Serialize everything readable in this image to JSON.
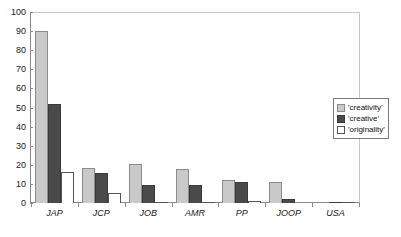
{
  "chart_data": {
    "type": "bar",
    "title": "",
    "subtitle": "",
    "xlabel": "",
    "ylabel": "",
    "ylim": [
      0,
      100
    ],
    "ytick_step": 10,
    "yticks": [
      0,
      10,
      20,
      30,
      40,
      50,
      60,
      70,
      80,
      90,
      100
    ],
    "ytick_labels": [
      "0",
      "10",
      "20",
      "30",
      "40",
      "50",
      "60",
      "70",
      "80",
      "90",
      "100"
    ],
    "grid": false,
    "legend_position": "right",
    "categories": [
      "JAP",
      "JCP",
      "JOB",
      "AMR",
      "PP",
      "JOOP",
      "USA"
    ],
    "series": [
      {
        "name": "'creativity'",
        "color": "#c9c9c9",
        "values": [
          90,
          18.5,
          20.5,
          18,
          12,
          11,
          0.6
        ]
      },
      {
        "name": "'creative'",
        "color": "#4a4a4a",
        "values": [
          52,
          15.5,
          9.5,
          9.3,
          11,
          2.2,
          0.3
        ]
      },
      {
        "name": "'originality'",
        "color": "#ffffff",
        "values": [
          16,
          5.5,
          0.7,
          0.7,
          1.2,
          0,
          0.6
        ]
      }
    ]
  },
  "legend": {
    "items": [
      {
        "label": "'creativity'"
      },
      {
        "label": "'creative'"
      },
      {
        "label": "'originality'"
      }
    ]
  }
}
